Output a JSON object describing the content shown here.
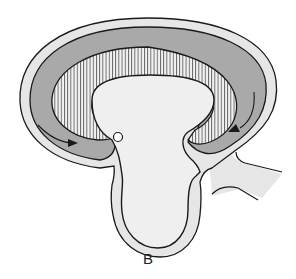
{
  "figure": {
    "panel_label": "B",
    "colors": {
      "outer_membrane_fill": "#e6e6e6",
      "cavity_fill": "#a9a9a9",
      "inner_body_fill": "#efefef",
      "outline": "#1a1a1a",
      "background": "#ffffff"
    },
    "elements": [
      {
        "name": "outer-envelope",
        "description": "light gray outer layer surrounding structure"
      },
      {
        "name": "dark-cavity",
        "description": "dark gray crescent-shaped cavity"
      },
      {
        "name": "striated-layer",
        "description": "radially striated band lining inner body"
      },
      {
        "name": "inner-body",
        "description": "light central mushroom-shaped body with stalk"
      },
      {
        "name": "left-arrow",
        "description": "arrow curving along left cavity pointing right"
      },
      {
        "name": "right-arrow",
        "description": "arrow curving along right cavity pointing left"
      },
      {
        "name": "small-circle",
        "description": "small open circle near left stalk junction"
      },
      {
        "name": "side-duct",
        "description": "light projection extending to the right"
      }
    ]
  }
}
